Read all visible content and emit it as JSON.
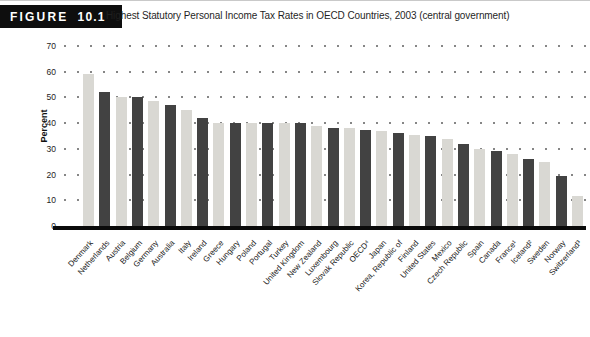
{
  "figure": {
    "tab_label": "FIGURE",
    "tab_number": "10.1",
    "title": "Highest Statutory Personal Income Tax Rates in OECD Countries, 2003 (central government)"
  },
  "chart_data": {
    "type": "bar",
    "title": "Highest Statutory Personal Income Tax Rates in OECD Countries, 2003 (central government)",
    "xlabel": "",
    "ylabel": "Percent",
    "ylim": [
      0,
      70
    ],
    "yticks": [
      70,
      60,
      50,
      40,
      30,
      20,
      10,
      0
    ],
    "grid": "horizontal dotted lines at each 10-percent level",
    "legend": "none",
    "bar_color_odd": "#d9d8d3",
    "bar_color_even": "#424242",
    "axis_color": "#0a0a0a",
    "categories": [
      "Denmark",
      "Netherlands",
      "Austria",
      "Belgium",
      "Germany",
      "Australia",
      "Italy",
      "Ireland",
      "Greece",
      "Hungary",
      "Poland",
      "Portugal",
      "Turkey",
      "United Kingdom",
      "New Zealand",
      "Luxembourg",
      "Slovak Republic",
      "OECD⁴",
      "Japan",
      "Korea, Republic of",
      "Finland",
      "United States",
      "Mexico",
      "Czech Republic",
      "Spain",
      "Canada",
      "France¹",
      "Iceland²",
      "Sweden",
      "Norway",
      "Switzerland³"
    ],
    "values": [
      59,
      52,
      50,
      50,
      48.5,
      47,
      45,
      42,
      40,
      40,
      40,
      40,
      40,
      40,
      39,
      38,
      38,
      37.5,
      37,
      36,
      35.5,
      35,
      34,
      32,
      30,
      29,
      28,
      26,
      25,
      19.5,
      11.5
    ]
  }
}
